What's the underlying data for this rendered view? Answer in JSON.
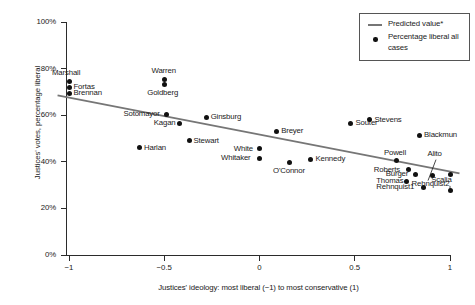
{
  "chart_data": {
    "type": "scatter",
    "title": "",
    "xlabel": "Justices' ideology: most liberal (−1) to most conservative (1)",
    "ylabel": "Justices' votes, percentage liberal",
    "xlim": [
      -1.12,
      1.08
    ],
    "ylim": [
      0,
      100
    ],
    "xticks": [
      -1,
      -0.5,
      0,
      0.5,
      1
    ],
    "xtick_labels": [
      "−1",
      "−0.5",
      "0",
      "0.5",
      "1"
    ],
    "yticks": [
      0,
      20,
      40,
      60,
      80,
      100
    ],
    "ytick_labels": [
      "0%",
      "20%",
      "40%",
      "60%",
      "80%",
      "100%"
    ],
    "grid": false,
    "legend_position": "top-right",
    "legend": [
      {
        "marker": "line",
        "label": "Predicted value*"
      },
      {
        "marker": "dot",
        "label": "Percentage liberal all cases"
      }
    ],
    "series": [
      {
        "name": "Percentage liberal all cases",
        "marker": "dot",
        "color": "#111111",
        "points": [
          {
            "label": "Marshall",
            "x": -1.0,
            "y": 74.5,
            "label_pos": "above"
          },
          {
            "label": "Fortas",
            "x": -1.0,
            "y": 72.0,
            "label_pos": "right"
          },
          {
            "label": "Brennan",
            "x": -1.0,
            "y": 69.5,
            "label_pos": "right"
          },
          {
            "label": "Warren",
            "x": -0.5,
            "y": 75.5,
            "label_pos": "above"
          },
          {
            "label": "Goldberg",
            "x": -0.5,
            "y": 73.0,
            "label_pos": "below"
          },
          {
            "label": "Sotomayor",
            "x": -0.49,
            "y": 60.5,
            "label_pos": "left"
          },
          {
            "label": "Kagan",
            "x": -0.42,
            "y": 56.5,
            "label_pos": "left"
          },
          {
            "label": "Ginsburg",
            "x": -0.28,
            "y": 59.0,
            "label_pos": "right"
          },
          {
            "label": "Harlan",
            "x": -0.63,
            "y": 46.0,
            "label_pos": "right"
          },
          {
            "label": "Stewart",
            "x": -0.37,
            "y": 49.0,
            "label_pos": "right"
          },
          {
            "label": "White",
            "x": 0.0,
            "y": 45.5,
            "label_pos": "left"
          },
          {
            "label": "Whitaker",
            "x": 0.0,
            "y": 41.5,
            "label_pos": "left"
          },
          {
            "label": "O'Connor",
            "x": 0.16,
            "y": 39.5,
            "label_pos": "below"
          },
          {
            "label": "Breyer",
            "x": 0.09,
            "y": 53.0,
            "label_pos": "right"
          },
          {
            "label": "Kennedy",
            "x": 0.27,
            "y": 41.0,
            "label_pos": "right"
          },
          {
            "label": "Souter",
            "x": 0.48,
            "y": 56.5,
            "label_pos": "right"
          },
          {
            "label": "Stevens",
            "x": 0.58,
            "y": 58.0,
            "label_pos": "right"
          },
          {
            "label": "Blackmun",
            "x": 0.84,
            "y": 51.5,
            "label_pos": "right"
          },
          {
            "label": "Powell",
            "x": 0.72,
            "y": 40.5,
            "label_pos": "above"
          },
          {
            "label": "Roberts",
            "x": 0.78,
            "y": 36.5,
            "label_pos": "left"
          },
          {
            "label": "Burger",
            "x": 0.82,
            "y": 34.5,
            "label_pos": "left"
          },
          {
            "label": "Thomas",
            "x": 0.77,
            "y": 31.5,
            "label_pos": "left"
          },
          {
            "label": "Rehnquist1",
            "x": 0.86,
            "y": 29.0,
            "label_pos": "left"
          },
          {
            "label": "Rehnquist2",
            "x": 0.91,
            "y": 34.0,
            "label_pos": "below"
          },
          {
            "label": "Alito",
            "x": 1.0,
            "y": 34.5,
            "label_pos": "callout-above"
          },
          {
            "label": "Scalia",
            "x": 1.0,
            "y": 27.5,
            "label_pos": "callout-above2"
          }
        ]
      }
    ],
    "trend_line": {
      "name": "Predicted value*",
      "color": "#767676",
      "x_start": -1.06,
      "y_start": 68.5,
      "x_end": 1.05,
      "y_end": 35.0
    }
  }
}
